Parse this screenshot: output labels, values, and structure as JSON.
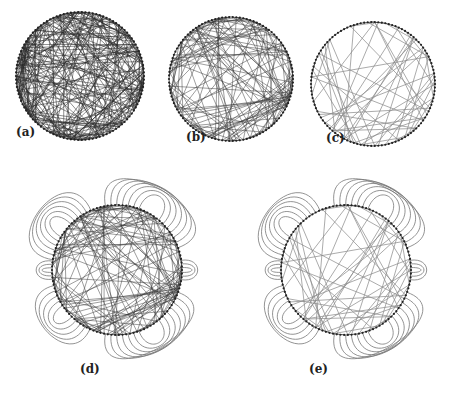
{
  "figure": {
    "panels": [
      {
        "id": "a",
        "label": "(a)",
        "cx": 80,
        "cy": 76,
        "r": 64,
        "nodes": 110,
        "edges": 260,
        "edge_color": "#2a2a2a",
        "edge_opacity": 0.75,
        "edge_width": 0.7,
        "seed": 11,
        "bundled": false,
        "label_x": 16,
        "label_y": 135
      },
      {
        "id": "b",
        "label": "(b)",
        "cx": 231,
        "cy": 79,
        "r": 62,
        "nodes": 110,
        "edges": 150,
        "edge_color": "#3a3a3a",
        "edge_opacity": 0.7,
        "edge_width": 0.7,
        "seed": 23,
        "bundled": false,
        "label_x": 186,
        "label_y": 140
      },
      {
        "id": "c",
        "label": "(c)",
        "cx": 373,
        "cy": 84,
        "r": 62,
        "nodes": 110,
        "edges": 55,
        "edge_color": "#8a8a8a",
        "edge_opacity": 0.8,
        "edge_width": 0.9,
        "seed": 37,
        "bundled": false,
        "label_x": 326,
        "label_y": 141
      },
      {
        "id": "d",
        "label": "(d)",
        "cx": 117,
        "cy": 270,
        "r": 65,
        "nodes": 110,
        "edges": 150,
        "edge_color": "#3a3a3a",
        "edge_opacity": 0.7,
        "edge_width": 0.7,
        "seed": 23,
        "bundled": true,
        "label_x": 80,
        "label_y": 372
      },
      {
        "id": "e",
        "label": "(e)",
        "cx": 346,
        "cy": 270,
        "r": 65,
        "nodes": 110,
        "edges": 55,
        "edge_color": "#8a8a8a",
        "edge_opacity": 0.8,
        "edge_width": 0.9,
        "seed": 37,
        "bundled": true,
        "label_x": 309,
        "label_y": 372
      }
    ],
    "outer_curve_color": "#777777"
  }
}
